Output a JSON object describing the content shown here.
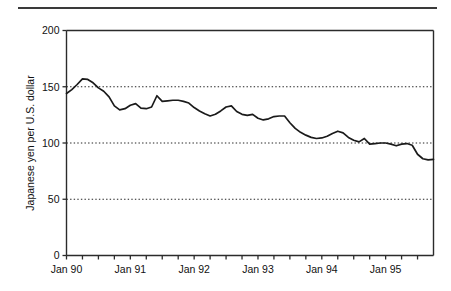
{
  "chart_data": {
    "type": "line",
    "title": "",
    "xlabel": "",
    "ylabel": "Japanese yen per U.S. dollar",
    "ylim": [
      0,
      200
    ],
    "yticks": [
      0,
      50,
      100,
      150,
      200
    ],
    "ytick_labels": [
      "0",
      "50",
      "100",
      "150",
      "200"
    ],
    "gridlines": [
      50,
      100,
      150
    ],
    "grid": "horizontal-dotted",
    "legend": "none",
    "xlim": [
      "1990-01",
      "1995-10"
    ],
    "xtick_labels": [
      "Jan 90",
      "Jan 91",
      "Jan 92",
      "Jan 93",
      "Jan 94",
      "Jan 95"
    ],
    "xtick_label_positions": [
      "1990-01",
      "1991-01",
      "1992-01",
      "1993-01",
      "1994-01",
      "1995-01"
    ],
    "minor_tick_interval_months": 3,
    "series": [
      {
        "name": "Japanese yen per U.S. dollar",
        "color": "#1a1a1a",
        "x": [
          "1990-01",
          "1990-02",
          "1990-03",
          "1990-04",
          "1990-05",
          "1990-06",
          "1990-07",
          "1990-08",
          "1990-09",
          "1990-10",
          "1990-11",
          "1990-12",
          "1991-01",
          "1991-02",
          "1991-03",
          "1991-04",
          "1991-05",
          "1991-06",
          "1991-07",
          "1991-08",
          "1991-09",
          "1991-10",
          "1991-11",
          "1991-12",
          "1992-01",
          "1992-02",
          "1992-03",
          "1992-04",
          "1992-05",
          "1992-06",
          "1992-07",
          "1992-08",
          "1992-09",
          "1992-10",
          "1992-11",
          "1992-12",
          "1993-01",
          "1993-02",
          "1993-03",
          "1993-04",
          "1993-05",
          "1993-06",
          "1993-07",
          "1993-08",
          "1993-09",
          "1993-10",
          "1993-11",
          "1993-12",
          "1994-01",
          "1994-02",
          "1994-03",
          "1994-04",
          "1994-05",
          "1994-06",
          "1994-07",
          "1994-08",
          "1994-09",
          "1994-10",
          "1994-11",
          "1994-12",
          "1995-01",
          "1995-02",
          "1995-03",
          "1995-04",
          "1995-05",
          "1995-06",
          "1995-07",
          "1995-08",
          "1995-09",
          "1995-10"
        ],
        "values": [
          144.0,
          147.5,
          152.0,
          157.0,
          156.5,
          153.5,
          149.0,
          146.0,
          141.0,
          133.0,
          129.5,
          130.5,
          133.5,
          135.0,
          131.0,
          130.5,
          132.0,
          142.0,
          137.0,
          137.5,
          138.0,
          138.0,
          137.0,
          135.5,
          131.5,
          128.5,
          126.0,
          124.0,
          125.5,
          128.5,
          132.0,
          133.0,
          128.0,
          125.5,
          124.5,
          125.5,
          122.0,
          120.5,
          121.5,
          123.5,
          124.0,
          124.0,
          118.0,
          113.0,
          109.5,
          107.0,
          105.0,
          104.0,
          104.5,
          106.0,
          108.5,
          110.5,
          109.0,
          105.0,
          102.5,
          101.0,
          104.0,
          99.0,
          99.5,
          100.0,
          100.0,
          99.0,
          97.5,
          99.0,
          99.5,
          98.0,
          90.0,
          86.0,
          85.0,
          85.5
        ]
      }
    ]
  },
  "axes": {
    "y_title": "Japanese yen per U.S. dollar"
  }
}
